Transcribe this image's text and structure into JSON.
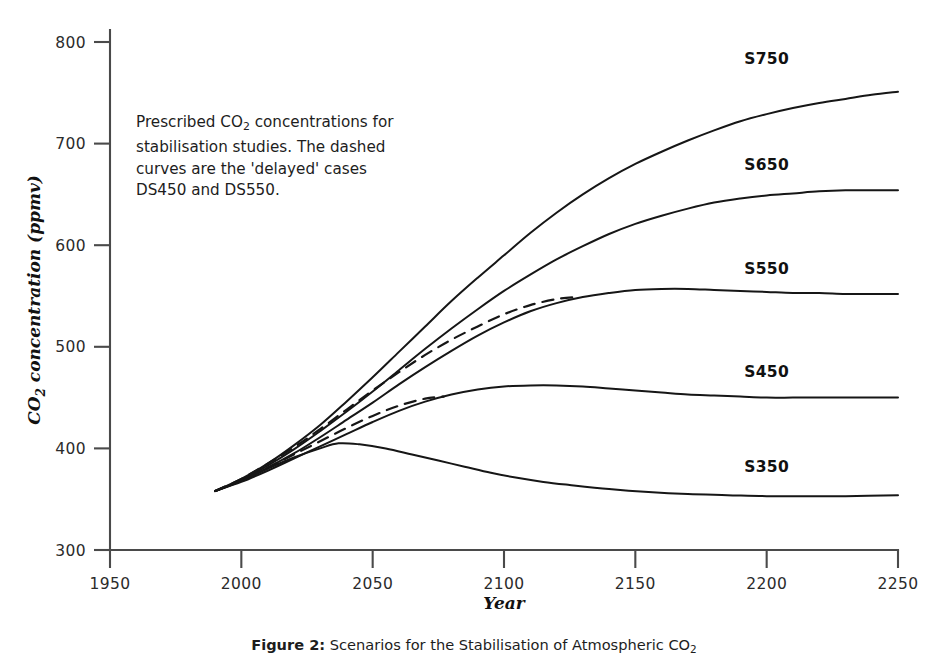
{
  "figure": {
    "note_line1_pre": "Prescribed CO",
    "note_sub": "2",
    "note_line1_post": " concentrations for",
    "note_line2": "stabilisation studies. The dashed",
    "note_line3": "curves are the 'delayed' cases",
    "note_line4": "DS450 and DS550.",
    "caption_lead": "Figure 2:",
    "caption_rest": " Scenarios for the Stabilisation of Atmospheric CO",
    "caption_sub": "2"
  },
  "chart_data": {
    "type": "line",
    "title": "Scenarios for the Stabilisation of Atmospheric CO2",
    "xlabel": "Year",
    "ylabel": "CO2 concentration (ppmv)",
    "xlim": [
      1950,
      2250
    ],
    "ylim": [
      300,
      800
    ],
    "xticks": [
      1950,
      2000,
      2050,
      2100,
      2150,
      2200,
      2250
    ],
    "yticks": [
      300,
      400,
      500,
      600,
      700,
      800
    ],
    "grid": false,
    "legend": "inline-curve-labels",
    "series": [
      {
        "name": "S750",
        "style": "solid",
        "label_x": 2200,
        "label_y": 778,
        "x": [
          1990,
          2000,
          2010,
          2020,
          2030,
          2040,
          2050,
          2060,
          2070,
          2080,
          2090,
          2100,
          2110,
          2120,
          2130,
          2140,
          2150,
          2160,
          2170,
          2180,
          2190,
          2200,
          2210,
          2220,
          2230,
          2240,
          2250
        ],
        "y": [
          358,
          370,
          385,
          403,
          423,
          446,
          470,
          495,
          520,
          545,
          568,
          590,
          612,
          632,
          650,
          666,
          680,
          692,
          703,
          713,
          722,
          729,
          735,
          740,
          744,
          748,
          751
        ]
      },
      {
        "name": "S650",
        "style": "solid",
        "label_x": 2200,
        "label_y": 674,
        "x": [
          1990,
          2000,
          2010,
          2020,
          2030,
          2040,
          2050,
          2060,
          2070,
          2080,
          2090,
          2100,
          2110,
          2120,
          2130,
          2140,
          2150,
          2160,
          2170,
          2180,
          2190,
          2200,
          2210,
          2220,
          2230,
          2240,
          2250
        ],
        "y": [
          358,
          369,
          383,
          399,
          417,
          436,
          456,
          477,
          498,
          518,
          537,
          555,
          571,
          586,
          599,
          611,
          621,
          629,
          636,
          642,
          646,
          649,
          651,
          653,
          654,
          654,
          654
        ]
      },
      {
        "name": "S550",
        "style": "solid",
        "label_x": 2200,
        "label_y": 572,
        "x": [
          1990,
          2000,
          2010,
          2020,
          2030,
          2040,
          2050,
          2060,
          2070,
          2080,
          2090,
          2100,
          2110,
          2120,
          2130,
          2140,
          2150,
          2160,
          2170,
          2180,
          2190,
          2200,
          2210,
          2220,
          2230,
          2240,
          2250
        ],
        "y": [
          358,
          368,
          381,
          395,
          411,
          428,
          445,
          463,
          480,
          496,
          511,
          524,
          535,
          543,
          549,
          553,
          556,
          557,
          557,
          556,
          555,
          554,
          553,
          553,
          552,
          552,
          552
        ]
      },
      {
        "name": "S450",
        "style": "solid",
        "label_x": 2200,
        "label_y": 470,
        "x": [
          1990,
          2000,
          2010,
          2020,
          2030,
          2040,
          2050,
          2060,
          2070,
          2080,
          2090,
          2100,
          2110,
          2120,
          2130,
          2140,
          2150,
          2160,
          2170,
          2180,
          2190,
          2200,
          2210,
          2220,
          2230,
          2240,
          2250
        ],
        "y": [
          358,
          367,
          378,
          390,
          402,
          414,
          426,
          437,
          446,
          453,
          458,
          461,
          462,
          462,
          461,
          459,
          457,
          455,
          453,
          452,
          451,
          450,
          450,
          450,
          450,
          450,
          450
        ]
      },
      {
        "name": "S350",
        "style": "solid",
        "label_x": 2200,
        "label_y": 377,
        "x": [
          1990,
          2000,
          2010,
          2020,
          2030,
          2037,
          2045,
          2055,
          2065,
          2075,
          2085,
          2095,
          2105,
          2115,
          2125,
          2140,
          2155,
          2170,
          2185,
          2200,
          2215,
          2230,
          2250
        ],
        "y": [
          358,
          368,
          380,
          391,
          400,
          405,
          404,
          400,
          394,
          388,
          382,
          376,
          371,
          367,
          364,
          360,
          357,
          355,
          354,
          353,
          353,
          353,
          354
        ]
      },
      {
        "name": "DS550",
        "style": "dashed",
        "x": [
          1990,
          2000,
          2010,
          2020,
          2030,
          2040,
          2050,
          2060,
          2070,
          2080,
          2090,
          2100,
          2110,
          2120,
          2128
        ],
        "y": [
          358,
          370,
          385,
          401,
          419,
          438,
          457,
          475,
          492,
          507,
          520,
          532,
          541,
          547,
          549
        ]
      },
      {
        "name": "DS450",
        "style": "dashed",
        "x": [
          1990,
          2000,
          2010,
          2020,
          2030,
          2040,
          2050,
          2060,
          2070,
          2077
        ],
        "y": [
          358,
          369,
          381,
          394,
          407,
          420,
          432,
          442,
          449,
          451
        ]
      }
    ]
  }
}
